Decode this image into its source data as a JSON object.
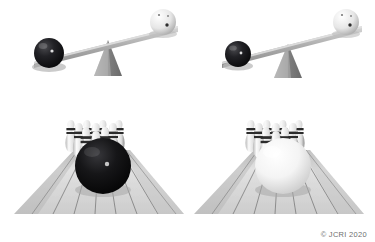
{
  "figure": {
    "background_color": "#ffffff",
    "credit": "© JCRI 2020",
    "credit_color": "#6e6e6e"
  },
  "panels": [
    {
      "id": "lever-left",
      "name": "lever-panel-black-ball-far",
      "description": "Tilted lever with black bowling ball on the lowered left end and white bowling ball on the raised right end, balanced on a triangular fulcrum",
      "fulcrum": {
        "shape": "triangle",
        "color": "#9a9a9a",
        "shadow_color": "#6f6f6f"
      },
      "beam": {
        "color": "#9c9c9c",
        "highlight_color": "#d6d6d6",
        "tilt": "down-left"
      },
      "balls": [
        {
          "name": "black-ball",
          "color": "#17171a",
          "side": "left",
          "radius": 15,
          "holes": 1
        },
        {
          "name": "white-ball",
          "color": "#efefef",
          "side": "right",
          "radius": 13,
          "holes": 3
        }
      ]
    },
    {
      "id": "lever-right",
      "name": "lever-panel-black-ball-near",
      "description": "Tilted lever with a smaller black bowling ball placed nearer the fulcrum on the lowered left end and a white bowling ball on the raised right end",
      "fulcrum": {
        "shape": "triangle",
        "color": "#9a9a9a",
        "shadow_color": "#6f6f6f"
      },
      "beam": {
        "color": "#9c9c9c",
        "highlight_color": "#d6d6d6",
        "tilt": "down-left"
      },
      "balls": [
        {
          "name": "black-ball",
          "color": "#17171a",
          "side": "left",
          "radius": 13,
          "holes": 1
        },
        {
          "name": "white-ball",
          "color": "#efefef",
          "side": "right",
          "radius": 13,
          "holes": 3
        }
      ]
    },
    {
      "id": "lane-left",
      "name": "bowling-lane-panel-black-ball",
      "description": "Bowling lane in perspective with ten pins at the end and a large black bowling ball rolling toward them",
      "lane": {
        "color": "#d9d9d9",
        "plank_line_color": "#5d5d5d",
        "planks": 10
      },
      "pins": {
        "count": 10,
        "body_color": "#f2f2f2",
        "stripe_color": "#2b2b2b",
        "shade_color": "#a9a9a9"
      },
      "ball": {
        "name": "black-ball",
        "color": "#111113",
        "highlight": "#cfcfcf",
        "radius": 28
      }
    },
    {
      "id": "lane-right",
      "name": "bowling-lane-panel-white-ball",
      "description": "Bowling lane in perspective with ten pins at the end and a large white bowling ball rolling toward them",
      "lane": {
        "color": "#d9d9d9",
        "plank_line_color": "#5d5d5d",
        "planks": 10
      },
      "pins": {
        "count": 10,
        "body_color": "#f2f2f2",
        "stripe_color": "#2b2b2b",
        "shade_color": "#a9a9a9"
      },
      "ball": {
        "name": "white-ball",
        "color": "#fdfdfd",
        "highlight": "#ffffff",
        "radius": 28
      }
    }
  ]
}
